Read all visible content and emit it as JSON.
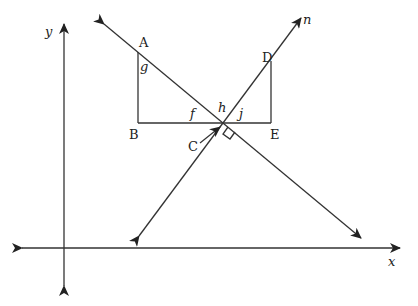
{
  "diagram": {
    "axes": {
      "x_label": "x",
      "y_label": "y"
    },
    "line_labels": {
      "n": "n"
    },
    "points": {
      "A": "A",
      "B": "B",
      "C": "C",
      "D": "D",
      "E": "E"
    },
    "angles": {
      "f": "f",
      "g": "g",
      "h": "h",
      "j": "j"
    },
    "annotations": {
      "right_angle_at": "C"
    },
    "colors": {
      "stroke": "#333333",
      "background": "#ffffff"
    }
  }
}
